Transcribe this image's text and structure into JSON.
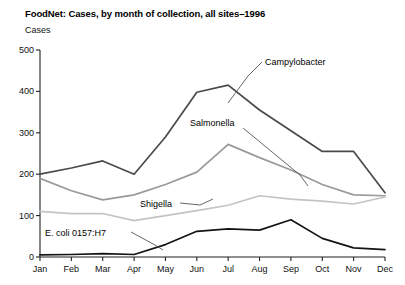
{
  "chart_data": {
    "type": "line",
    "title": "FoodNet: Cases, by month of collection, all sites–1996",
    "xlabel": "",
    "ylabel": "Cases",
    "categories": [
      "Jan",
      "Feb",
      "Mar",
      "Apr",
      "May",
      "Jun",
      "Jul",
      "Aug",
      "Sep",
      "Oct",
      "Nov",
      "Dec"
    ],
    "ylim": [
      0,
      500
    ],
    "yticks": [
      0,
      100,
      200,
      300,
      400,
      500
    ],
    "grid": false,
    "legend_position": "inline-annotations",
    "series": [
      {
        "name": "Campylobacter",
        "color": "#4a4a4a",
        "values": [
          200,
          215,
          232,
          200,
          290,
          398,
          415,
          355,
          305,
          255,
          255,
          155
        ]
      },
      {
        "name": "Salmonella",
        "color": "#9a9a9a",
        "values": [
          190,
          160,
          138,
          150,
          175,
          205,
          272,
          240,
          210,
          175,
          150,
          148
        ]
      },
      {
        "name": "Shigella",
        "color": "#c4c4c4",
        "values": [
          110,
          105,
          105,
          88,
          100,
          112,
          125,
          148,
          140,
          135,
          128,
          145
        ]
      },
      {
        "name": "E. coli 0157:H7",
        "color": "#141414",
        "values": [
          5,
          6,
          8,
          6,
          30,
          62,
          68,
          65,
          90,
          45,
          22,
          18
        ]
      }
    ]
  },
  "annotations": {
    "campylobacter": "Campylobacter",
    "salmonella": "Salmonella",
    "shigella": "Shigella",
    "ecoli": "E. coli 0157:H7"
  }
}
